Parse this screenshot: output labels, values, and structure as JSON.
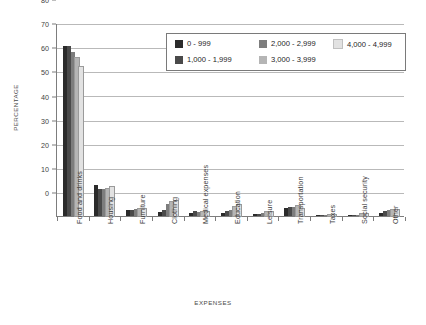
{
  "chart_data": {
    "type": "bar",
    "title": "",
    "xlabel": "EXPENSES",
    "ylabel": "PERCENTAGE",
    "ylim": [
      0,
      80
    ],
    "ytick_step": 10,
    "yticks": [
      "0",
      "10",
      "20",
      "30",
      "40",
      "50",
      "60",
      "70",
      "80"
    ],
    "grid": true,
    "legend_position": "top-right-inside",
    "categories": [
      "Food and drinks",
      "Housing",
      "Furniture",
      "Clothing",
      "Medical expenses",
      "Education",
      "Leisure",
      "Transportation",
      "Taxes",
      "Social security",
      "Other"
    ],
    "series": [
      {
        "name": "0 - 999",
        "color": "#2b2b2b",
        "values": [
          70.5,
          13.0,
          2.5,
          1.5,
          1.3,
          1.2,
          0.8,
          3.2,
          0.2,
          0.3,
          1.2
        ]
      },
      {
        "name": "1,000 - 1,999",
        "color": "#4a4a4a",
        "values": [
          70.3,
          11.2,
          2.6,
          2.5,
          2.2,
          2.0,
          1.0,
          3.6,
          0.3,
          0.5,
          2.0
        ]
      },
      {
        "name": "2,000 - 2,999",
        "color": "#7d7d7d",
        "values": [
          67.8,
          11.0,
          2.8,
          4.8,
          1.7,
          2.7,
          1.4,
          3.9,
          0.4,
          0.6,
          2.5
        ]
      },
      {
        "name": "3,000 - 3,999",
        "color": "#b5b5b5",
        "values": [
          65.5,
          11.4,
          2.9,
          5.8,
          1.6,
          3.6,
          1.6,
          4.2,
          0.4,
          0.8,
          2.6
        ]
      },
      {
        "name": "4,000 - 4,999",
        "color": "#e2e2e2",
        "values": [
          61.8,
          12.0,
          3.0,
          6.2,
          1.5,
          4.4,
          1.8,
          3.0,
          0.5,
          1.0,
          2.4
        ]
      }
    ]
  },
  "axes": {
    "y_title": "PERCENTAGE",
    "x_title": "EXPENSES"
  }
}
